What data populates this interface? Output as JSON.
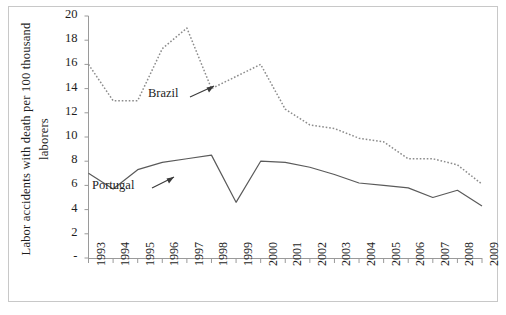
{
  "chart_data": {
    "type": "line",
    "title": "",
    "xlabel": "",
    "ylabel": "Labor accidents with death per 100 thousand laborers",
    "ylabel_line1": "Labor accidents with death",
    "ylabel_line2": "per 100 thousand laborers",
    "x": [
      1993,
      1994,
      1995,
      1996,
      1997,
      1998,
      1999,
      2000,
      2001,
      2002,
      2003,
      2004,
      2005,
      2006,
      2007,
      2008,
      2009
    ],
    "categories": [
      "1993",
      "1994",
      "1995",
      "1996",
      "1997",
      "1998",
      "1999",
      "2000",
      "2001",
      "2002",
      "2003",
      "2004",
      "2005",
      "2006",
      "2007",
      "2008",
      "2009"
    ],
    "ylim": [
      0,
      20
    ],
    "yticks": [
      0,
      2,
      4,
      6,
      8,
      10,
      12,
      14,
      16,
      18,
      20
    ],
    "ytick_labels": [
      "-",
      "2",
      "4",
      "6",
      "8",
      "10",
      "12",
      "14",
      "16",
      "18",
      "20"
    ],
    "grid": false,
    "legend_position": "inline-annotations",
    "series": [
      {
        "name": "Brazil",
        "style": "dotted",
        "color": "#8c8c8c",
        "values": [
          16.0,
          13.0,
          13.0,
          17.3,
          19.0,
          14.0,
          15.0,
          16.0,
          12.3,
          11.0,
          10.7,
          9.9,
          9.6,
          8.2,
          8.2,
          7.7,
          6.1
        ]
      },
      {
        "name": "Portugal",
        "style": "solid",
        "color": "#5a5a5a",
        "values": [
          7.0,
          5.7,
          7.3,
          7.9,
          8.2,
          8.5,
          4.6,
          8.0,
          7.9,
          7.5,
          6.9,
          6.2,
          6.0,
          5.8,
          5.0,
          5.6,
          4.3
        ]
      }
    ],
    "annotations": [
      {
        "text": "Brazil",
        "points_to_series": "Brazil",
        "arrow": true
      },
      {
        "text": "Portugal",
        "points_to_series": "Portugal",
        "arrow": true
      }
    ]
  }
}
